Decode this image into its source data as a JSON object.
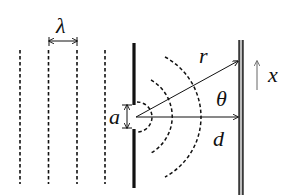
{
  "diagram": {
    "type": "single-slit diffraction schematic",
    "labels": {
      "wavelength": "λ",
      "slit_width": "a",
      "path_length": "r",
      "angle": "θ",
      "screen_distance": "d",
      "screen_coordinate": "x"
    },
    "plane_wavefronts": {
      "count": 4,
      "x_positions": [
        20,
        48,
        77,
        105
      ],
      "style": "dashed"
    },
    "barrier": {
      "label": "slit barrier",
      "style": "solid thick"
    },
    "diffracted_wavefronts": {
      "count": 3,
      "style": "dashed arcs"
    },
    "screen": {
      "style": "double line"
    },
    "colors": {
      "ink": "#111111",
      "screen_fill": "#888888"
    }
  }
}
